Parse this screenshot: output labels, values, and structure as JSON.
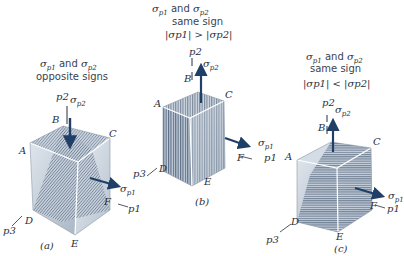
{
  "figure": {
    "panels": [
      {
        "id": "a",
        "caption": "(a)",
        "condition_line1_sym1": "σ",
        "condition_line1_sub1": "p1",
        "condition_line1_mid": " and ",
        "condition_line1_sym2": "σ",
        "condition_line1_sub2": "p2",
        "condition_line2": "opposite signs",
        "condition_line3": "",
        "vertices": [
          "A",
          "B",
          "C",
          "D",
          "E",
          "F"
        ],
        "axes": [
          "p1",
          "p2",
          "p3"
        ],
        "stress_labels": {
          "s1": "σ",
          "s1_sub": "p1",
          "s2": "σ",
          "s2_sub": "p2"
        },
        "sigma_p2_direction": "down"
      },
      {
        "id": "b",
        "caption": "(b)",
        "condition_line1_sym1": "σ",
        "condition_line1_sub1": "p1",
        "condition_line1_mid": " and ",
        "condition_line1_sym2": "σ",
        "condition_line1_sub2": "p2",
        "condition_line2": "same sign",
        "condition_line3": "|σp1| > |σp2|",
        "vertices": [
          "A",
          "B",
          "C",
          "D",
          "E",
          "F"
        ],
        "axes": [
          "p1",
          "p2",
          "p3"
        ],
        "stress_labels": {
          "s1": "σ",
          "s1_sub": "p1",
          "s2": "σ",
          "s2_sub": "p2"
        },
        "sigma_p2_direction": "up"
      },
      {
        "id": "c",
        "caption": "(c)",
        "condition_line1_sym1": "σ",
        "condition_line1_sub1": "p1",
        "condition_line1_mid": " and ",
        "condition_line1_sym2": "σ",
        "condition_line1_sub2": "p2",
        "condition_line2": "same sign",
        "condition_line3": "|σp1| < |σp2|",
        "vertices": [
          "A",
          "B",
          "C",
          "D",
          "E",
          "F"
        ],
        "axes": [
          "p1",
          "p2",
          "p3"
        ],
        "stress_labels": {
          "s1": "σ",
          "s1_sub": "p1",
          "s2": "σ",
          "s2_sub": "p2"
        },
        "sigma_p2_direction": "up"
      }
    ],
    "colors": {
      "arrow": "#1f3f66",
      "cube_face": "#c9d3de",
      "hatch": "#3d4f66",
      "edge": "#ffffff",
      "text": "#2a2f38"
    }
  }
}
